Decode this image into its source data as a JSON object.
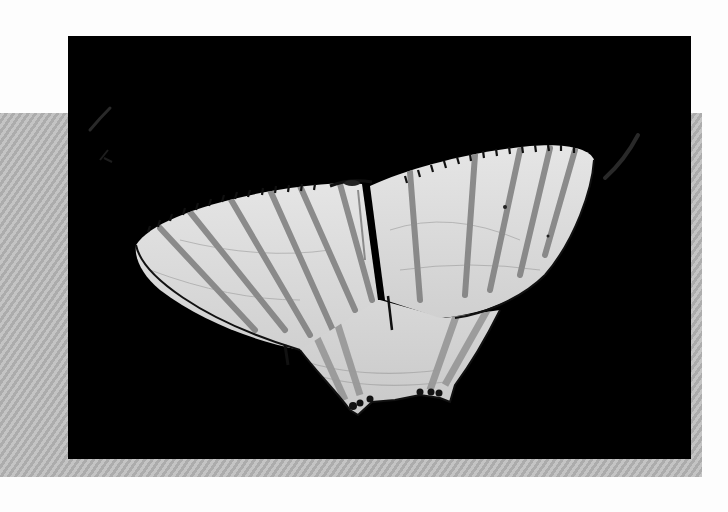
{
  "image": {
    "subject": "white striped moth with wings spread on black background",
    "alt": "Moth photograph"
  },
  "colors": {
    "page_background": "#fdfdfd",
    "stripe_band_light": "#c4c4c4",
    "stripe_band_dark": "#acacac",
    "photo_background": "#000000",
    "wing_base": "#dcdcdc",
    "wing_highlight": "#ececec",
    "wing_stripe": "#7a7a7a",
    "wing_edge": "#1a1a1a"
  }
}
